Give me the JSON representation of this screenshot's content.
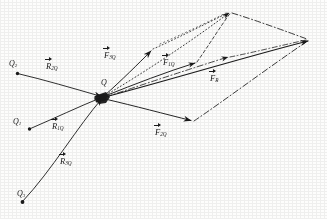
{
  "figure": {
    "type": "physics-vector-diagram",
    "ink_color": "#1a1a1a",
    "background_color": "#fdfdfc",
    "width": 327,
    "height": 219
  },
  "charges": [
    {
      "id": "Q2",
      "label_main": "Q",
      "label_sub": "2",
      "x": 17,
      "y": 73,
      "label_x": 9,
      "label_y": 60
    },
    {
      "id": "Q1",
      "label_main": "Q",
      "label_sub": "1",
      "x": 29,
      "y": 129,
      "label_x": 13,
      "label_y": 118
    },
    {
      "id": "Q3",
      "label_main": "Q",
      "label_sub": "3",
      "x": 22,
      "y": 202,
      "label_x": 17,
      "label_y": 190
    },
    {
      "id": "Q",
      "label_main": "Q",
      "label_sub": "",
      "x": 103,
      "y": 97,
      "label_x": 101,
      "label_y": 79
    }
  ],
  "position_vectors": [
    {
      "id": "R2Q",
      "symbol": "R",
      "sub": "2Q",
      "label_x": 46,
      "label_y": 62,
      "from": "Q2",
      "to": "Q"
    },
    {
      "id": "R1Q",
      "symbol": "R",
      "sub": "1Q",
      "label_x": 52,
      "label_y": 122,
      "from": "Q1",
      "to": "Q"
    },
    {
      "id": "R3Q",
      "symbol": "R",
      "sub": "3Q",
      "label_x": 60,
      "label_y": 157,
      "from": "Q3",
      "to": "Q"
    }
  ],
  "force_vectors": [
    {
      "id": "F3Q",
      "symbol": "F",
      "sub": "3Q",
      "label_x": 104,
      "label_y": 51,
      "tip_x": 152,
      "tip_y": 50
    },
    {
      "id": "F1Q",
      "symbol": "F",
      "sub": "1Q",
      "label_x": 163,
      "label_y": 58,
      "tip_x": 196,
      "tip_y": 63
    },
    {
      "id": "F2Q",
      "symbol": "F",
      "sub": "2Q",
      "label_x": 155,
      "label_y": 128,
      "tip_x": 192,
      "tip_y": 121
    },
    {
      "id": "FR",
      "symbol": "F",
      "sub": "R",
      "label_x": 210,
      "label_y": 74,
      "tip_x": 310,
      "tip_y": 40
    }
  ],
  "construction": {
    "apex_x": 231,
    "apex_y": 12,
    "resultant_tip_x": 310,
    "resultant_tip_y": 40,
    "line_styles": [
      "dotted",
      "dashed",
      "dash-dot"
    ]
  }
}
